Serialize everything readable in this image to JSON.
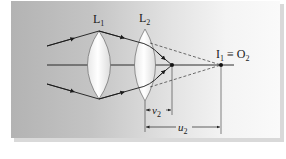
{
  "diagram": {
    "labels": {
      "lens1": "L",
      "lens1_sub": "1",
      "lens2": "L",
      "lens2_sub": "2",
      "point": "I",
      "point_sub": "1",
      "equiv": " ≡ O",
      "equiv_sub": "2",
      "v2": "v",
      "v2_sub": "2",
      "u2": "u",
      "u2_sub": "2"
    },
    "colors": {
      "ray": "#1a1a1a",
      "lens_fill": "#ffffff",
      "lens_stroke": "#555555",
      "dashed": "#333333"
    }
  }
}
